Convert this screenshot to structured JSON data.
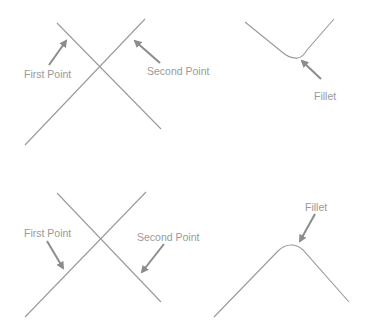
{
  "diagram": {
    "panels": [
      {
        "id": "top-left",
        "labels": {
          "first": "First Point",
          "second": "Second Point"
        }
      },
      {
        "id": "top-right",
        "labels": {
          "fillet": "Fillet"
        }
      },
      {
        "id": "bottom-left",
        "labels": {
          "first": "First Point",
          "second": "Second Point"
        }
      },
      {
        "id": "bottom-right",
        "labels": {
          "fillet": "Fillet"
        }
      }
    ],
    "colors": {
      "line": "#9a9a9a",
      "arrow": "#8c8c8c",
      "text": "#9a9a9a",
      "background": "#ffffff"
    }
  }
}
